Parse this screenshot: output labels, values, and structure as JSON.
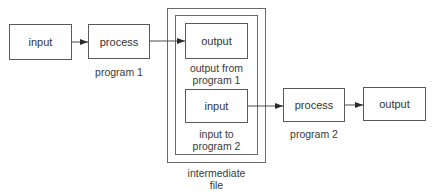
{
  "diagram": {
    "program1": {
      "input_box": "input",
      "process_box": "process",
      "caption": "program 1"
    },
    "intermediate_file": {
      "output_box": "output",
      "output_caption_line1": "output from",
      "output_caption_line2": "program 1",
      "input_box": "input",
      "input_caption_line1": "input to",
      "input_caption_line2": "program 2",
      "caption_line1": "intermediate",
      "caption_line2": "file"
    },
    "program2": {
      "process_box": "process",
      "output_box": "output",
      "caption": "program 2"
    },
    "colors": {
      "line": "#5a5a5a",
      "text": "#333333",
      "background": "#ffffff"
    }
  }
}
